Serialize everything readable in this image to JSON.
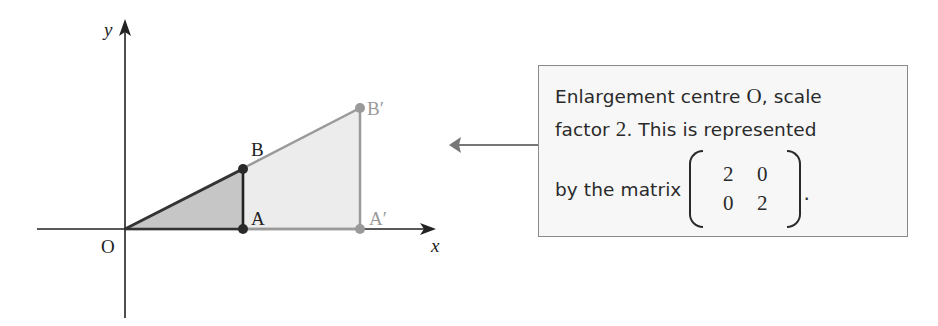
{
  "diagram": {
    "axes": {
      "x_label": "x",
      "y_label": "y",
      "origin_label": "O"
    },
    "original_shape": {
      "points": [
        {
          "label": "O",
          "coords": [
            0,
            0
          ]
        },
        {
          "label": "A",
          "coords": [
            2,
            0
          ]
        },
        {
          "label": "B",
          "coords": [
            2,
            1
          ]
        }
      ],
      "fill": "#c6c6c6",
      "stroke": "#333333"
    },
    "image_shape": {
      "points": [
        {
          "label": "O",
          "coords": [
            0,
            0
          ]
        },
        {
          "label": "A′",
          "coords": [
            4,
            0
          ]
        },
        {
          "label": "B′",
          "coords": [
            4,
            2
          ]
        }
      ],
      "fill": "#ececec",
      "stroke": "#9a9a9a"
    },
    "labels": {
      "A": "A",
      "B": "B",
      "A_prime": "A′",
      "B_prime": "B′"
    }
  },
  "callout": {
    "line1_prefix": "Enlargement centre ",
    "line1_center": "O",
    "line1_suffix": ", scale",
    "line2_prefix": "factor ",
    "line2_factor": "2",
    "line2_suffix": ". This is represented",
    "line3_prefix": "by the matrix",
    "matrix": [
      [
        "2",
        "0"
      ],
      [
        "0",
        "2"
      ]
    ],
    "line3_suffix": "."
  },
  "colors": {
    "axis": "#222222",
    "original_fill": "#c6c6c6",
    "original_stroke": "#333333",
    "image_fill": "#ececec",
    "image_stroke": "#9a9a9a",
    "callout_bg": "#f7f7f7",
    "callout_border": "#8a8a8a",
    "arrow": "#777777"
  }
}
